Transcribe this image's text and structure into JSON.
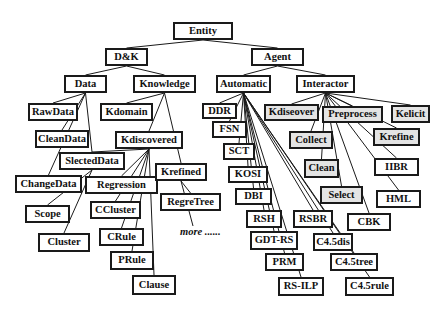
{
  "diagram": {
    "type": "tree",
    "root": "Entity",
    "nodes": [
      {
        "id": "entity",
        "label": "Entity",
        "x": 173,
        "y": 22,
        "w": 60,
        "h": 18,
        "shaded": false
      },
      {
        "id": "dk",
        "label": "D&K",
        "x": 105,
        "y": 48,
        "w": 43,
        "h": 18,
        "shaded": false
      },
      {
        "id": "agent",
        "label": "Agent",
        "x": 251,
        "y": 48,
        "w": 53,
        "h": 18,
        "shaded": false
      },
      {
        "id": "data",
        "label": "Data",
        "x": 64,
        "y": 75,
        "w": 43,
        "h": 18,
        "shaded": false
      },
      {
        "id": "knowledge",
        "label": "Knowledge",
        "x": 133,
        "y": 75,
        "w": 63,
        "h": 18,
        "shaded": false
      },
      {
        "id": "automatic",
        "label": "Automatic",
        "x": 216,
        "y": 75,
        "w": 55,
        "h": 18,
        "shaded": false
      },
      {
        "id": "interactor",
        "label": "Interactor",
        "x": 296,
        "y": 75,
        "w": 59,
        "h": 18,
        "shaded": false
      },
      {
        "id": "rawdata",
        "label": "RawData",
        "x": 28,
        "y": 103,
        "w": 50,
        "h": 18,
        "shaded": false
      },
      {
        "id": "kdomain",
        "label": "Kdomain",
        "x": 100,
        "y": 103,
        "w": 53,
        "h": 18,
        "shaded": false
      },
      {
        "id": "ddr",
        "label": "DDR",
        "x": 202,
        "y": 103,
        "w": 35,
        "h": 16,
        "shaded": false
      },
      {
        "id": "kdiseover",
        "label": "Kdiseover",
        "x": 264,
        "y": 104,
        "w": 55,
        "h": 17,
        "shaded": true
      },
      {
        "id": "preprocess",
        "label": "Preprocess",
        "x": 322,
        "y": 106,
        "w": 61,
        "h": 17,
        "shaded": true
      },
      {
        "id": "kelicit",
        "label": "Kelicit",
        "x": 391,
        "y": 105,
        "w": 39,
        "h": 18,
        "shaded": true
      },
      {
        "id": "cleandata",
        "label": "CleanData",
        "x": 35,
        "y": 130,
        "w": 54,
        "h": 18,
        "shaded": false
      },
      {
        "id": "kdiscovered",
        "label": "Kdiscovered",
        "x": 115,
        "y": 131,
        "w": 68,
        "h": 18,
        "shaded": false
      },
      {
        "id": "fsn",
        "label": "FSN",
        "x": 212,
        "y": 121,
        "w": 35,
        "h": 17,
        "shaded": false
      },
      {
        "id": "collect",
        "label": "Collect",
        "x": 289,
        "y": 131,
        "w": 44,
        "h": 18,
        "shaded": true
      },
      {
        "id": "krefine",
        "label": "Krefine",
        "x": 373,
        "y": 128,
        "w": 47,
        "h": 18,
        "shaded": true
      },
      {
        "id": "slecteddata",
        "label": "SlectedData",
        "x": 59,
        "y": 152,
        "w": 66,
        "h": 18,
        "shaded": false
      },
      {
        "id": "sct",
        "label": "SCT",
        "x": 223,
        "y": 143,
        "w": 32,
        "h": 17,
        "shaded": false
      },
      {
        "id": "clean",
        "label": "Clean",
        "x": 304,
        "y": 159,
        "w": 35,
        "h": 19,
        "shaded": true
      },
      {
        "id": "iibr",
        "label": "IIBR",
        "x": 374,
        "y": 158,
        "w": 45,
        "h": 18,
        "shaded": false
      },
      {
        "id": "changedata",
        "label": "ChangeData",
        "x": 15,
        "y": 175,
        "w": 67,
        "h": 18,
        "shaded": false
      },
      {
        "id": "regression",
        "label": "Regression",
        "x": 85,
        "y": 176,
        "w": 73,
        "h": 18,
        "shaded": false
      },
      {
        "id": "krefined",
        "label": "Krefined",
        "x": 155,
        "y": 163,
        "w": 52,
        "h": 18,
        "shaded": false
      },
      {
        "id": "kosi",
        "label": "KOSI",
        "x": 228,
        "y": 166,
        "w": 40,
        "h": 17,
        "shaded": false
      },
      {
        "id": "select",
        "label": "Select",
        "x": 320,
        "y": 186,
        "w": 43,
        "h": 18,
        "shaded": true
      },
      {
        "id": "hml",
        "label": "HML",
        "x": 376,
        "y": 190,
        "w": 45,
        "h": 18,
        "shaded": false
      },
      {
        "id": "scope",
        "label": "Scope",
        "x": 25,
        "y": 205,
        "w": 45,
        "h": 18,
        "shaded": false
      },
      {
        "id": "ccluster",
        "label": "CCluster",
        "x": 90,
        "y": 201,
        "w": 51,
        "h": 18,
        "shaded": false
      },
      {
        "id": "regretree",
        "label": "RegreTree",
        "x": 160,
        "y": 193,
        "w": 61,
        "h": 18,
        "shaded": false
      },
      {
        "id": "dbi",
        "label": "DBI",
        "x": 235,
        "y": 188,
        "w": 37,
        "h": 17,
        "shaded": false
      },
      {
        "id": "rsh",
        "label": "RSH",
        "x": 246,
        "y": 210,
        "w": 36,
        "h": 18,
        "shaded": false
      },
      {
        "id": "rsbr",
        "label": "RSBR",
        "x": 293,
        "y": 210,
        "w": 40,
        "h": 18,
        "shaded": false
      },
      {
        "id": "cbk",
        "label": "CBK",
        "x": 347,
        "y": 213,
        "w": 44,
        "h": 18,
        "shaded": false
      },
      {
        "id": "cluster",
        "label": "Cluster",
        "x": 38,
        "y": 233,
        "w": 52,
        "h": 19,
        "shaded": false
      },
      {
        "id": "crule",
        "label": "CRule",
        "x": 99,
        "y": 228,
        "w": 45,
        "h": 18,
        "shaded": false
      },
      {
        "id": "gdtrs",
        "label": "GDT-RS",
        "x": 250,
        "y": 231,
        "w": 48,
        "h": 19,
        "shaded": false
      },
      {
        "id": "c45dis",
        "label": "C4.5dis",
        "x": 313,
        "y": 233,
        "w": 40,
        "h": 18,
        "shaded": false
      },
      {
        "id": "prm",
        "label": "PRM",
        "x": 265,
        "y": 253,
        "w": 39,
        "h": 18,
        "shaded": false
      },
      {
        "id": "c45tree",
        "label": "C4.5tree",
        "x": 330,
        "y": 253,
        "w": 48,
        "h": 18,
        "shaded": false
      },
      {
        "id": "prule",
        "label": "PRule",
        "x": 110,
        "y": 251,
        "w": 44,
        "h": 19,
        "shaded": false
      },
      {
        "id": "rsilp",
        "label": "RS-ILP",
        "x": 278,
        "y": 277,
        "w": 46,
        "h": 19,
        "shaded": false
      },
      {
        "id": "c45rule",
        "label": "C4.5rule",
        "x": 345,
        "y": 277,
        "w": 49,
        "h": 19,
        "shaded": false
      },
      {
        "id": "clause",
        "label": "Clause",
        "x": 132,
        "y": 275,
        "w": 44,
        "h": 20,
        "shaded": false
      }
    ],
    "edges": [
      [
        "entity",
        "dk"
      ],
      [
        "entity",
        "agent"
      ],
      [
        "dk",
        "data"
      ],
      [
        "dk",
        "knowledge"
      ],
      [
        "agent",
        "automatic"
      ],
      [
        "agent",
        "interactor"
      ],
      [
        "data",
        "rawdata"
      ],
      [
        "data",
        "cleandata"
      ],
      [
        "data",
        "slecteddata"
      ],
      [
        "data",
        "changedata"
      ],
      [
        "slecteddata",
        "scope"
      ],
      [
        "slecteddata",
        "cluster"
      ],
      [
        "knowledge",
        "kdomain"
      ],
      [
        "knowledge",
        "kdiscovered"
      ],
      [
        "knowledge",
        "krefined"
      ],
      [
        "kdiscovered",
        "slecteddata"
      ],
      [
        "kdiscovered",
        "regression"
      ],
      [
        "kdiscovered",
        "ccluster"
      ],
      [
        "kdiscovered",
        "crule"
      ],
      [
        "kdiscovered",
        "prule"
      ],
      [
        "kdiscovered",
        "clause"
      ],
      [
        "krefined",
        "regretree"
      ],
      [
        "krefined",
        "more"
      ],
      [
        "automatic",
        "ddr"
      ],
      [
        "automatic",
        "fsn"
      ],
      [
        "automatic",
        "sct"
      ],
      [
        "automatic",
        "kosi"
      ],
      [
        "automatic",
        "dbi"
      ],
      [
        "automatic",
        "rsh"
      ],
      [
        "automatic",
        "gdtrs"
      ],
      [
        "automatic",
        "prm"
      ],
      [
        "automatic",
        "rsilp"
      ],
      [
        "automatic",
        "rsbr"
      ],
      [
        "automatic",
        "c45dis"
      ],
      [
        "automatic",
        "c45tree"
      ],
      [
        "automatic",
        "c45rule"
      ],
      [
        "interactor",
        "kdiseover"
      ],
      [
        "interactor",
        "preprocess"
      ],
      [
        "interactor",
        "kelicit"
      ],
      [
        "interactor",
        "collect"
      ],
      [
        "interactor",
        "clean"
      ],
      [
        "interactor",
        "select"
      ],
      [
        "interactor",
        "krefine"
      ],
      [
        "interactor",
        "iibr"
      ],
      [
        "interactor",
        "hml"
      ],
      [
        "interactor",
        "cbk"
      ]
    ],
    "annotation": {
      "id": "more",
      "label": "more ......",
      "x": 180,
      "y": 226
    }
  },
  "colors": {
    "line": "#1a1a1a",
    "box_fill": "#ffffff",
    "shaded_fill": "#e4e4e4"
  }
}
